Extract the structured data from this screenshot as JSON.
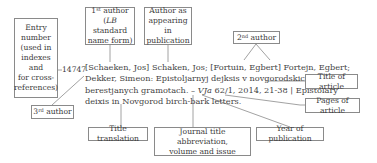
{
  "entry_number": "14747",
  "citation": {
    "line1": "[Schaeken, Jos] Schaken, Jos; [Fortuin, Egbert] Fortejn, Egbert;",
    "line2": "Dekker, Simeon: Epistoljarnyj dejksis v novgorodskich",
    "line3_pre": "berestjanych gramotach. – ",
    "line3_journal": "VJa",
    "line3_post": " 62/1, 2014, 21-38 | Epistolary",
    "line4": "deixis in Novgorod birch-bark letters."
  },
  "labels": {
    "entry_number": [
      "Entry",
      "number",
      "(used in",
      "indexes and",
      "for cross-",
      "references)"
    ],
    "first_author": {
      "ordinal": "1",
      "sup": "st",
      "word": " author",
      "line2_italic": "LB",
      "line2_rest": " standard",
      "line3": "name form)"
    },
    "author_as": [
      "Author as",
      "appearing in",
      "publication"
    ],
    "second_author": {
      "ordinal": "2",
      "sup": "nd",
      "word": " author"
    },
    "third_author": {
      "ordinal": "3",
      "sup": "rd",
      "word": " author"
    },
    "title_of_article": "Title of article",
    "pages_of_article": "Pages of article",
    "title_translation": "Title translation",
    "journal": [
      "Journal title abbreviation,",
      "volume and issue"
    ],
    "year": "Year of publication"
  },
  "colors": {
    "line": "#8a8a8a",
    "text": "#3a3a3a"
  }
}
